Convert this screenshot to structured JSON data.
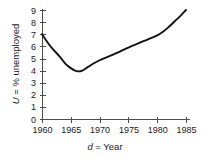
{
  "chart_data": {
    "type": "line",
    "title": "",
    "subtitle": "",
    "xlabel": "d = Year",
    "xlabel_var": "d",
    "xlabel_rest": " = Year",
    "ylabel": "U = % unemployed",
    "ylabel_var": "U",
    "ylabel_rest": " = % unemployed",
    "xlim": [
      1960,
      1985
    ],
    "ylim": [
      0,
      9
    ],
    "xticks": [
      1960,
      1965,
      1970,
      1975,
      1980,
      1985
    ],
    "xtick_labels": [
      "1960",
      "1965",
      "1970",
      "1975",
      "1980",
      "1985"
    ],
    "yticks": [
      0,
      1,
      2,
      3,
      4,
      5,
      6,
      7,
      8,
      9
    ],
    "ytick_labels": [
      "0",
      "1",
      "2",
      "3",
      "4",
      "5",
      "6",
      "7",
      "8",
      "9"
    ],
    "grid": false,
    "legend": false,
    "legend_position": "none",
    "line_color": "#111111",
    "axis_color": "#4d4d4d",
    "background_color": "#ffffff",
    "series": [
      {
        "name": "U = % unemployed",
        "x": [
          1960,
          1961,
          1962,
          1963,
          1964,
          1965,
          1966,
          1967,
          1968,
          1969,
          1970,
          1971,
          1972,
          1973,
          1974,
          1975,
          1976,
          1977,
          1978,
          1979,
          1980,
          1981,
          1982,
          1983,
          1984,
          1985
        ],
        "values": [
          7.0,
          6.3,
          5.7,
          5.2,
          4.6,
          4.2,
          3.95,
          4.0,
          4.3,
          4.6,
          4.85,
          5.05,
          5.25,
          5.45,
          5.68,
          5.9,
          6.1,
          6.3,
          6.5,
          6.7,
          6.9,
          7.2,
          7.6,
          8.05,
          8.5,
          9.0
        ]
      }
    ]
  },
  "figure": {
    "plot_area": {
      "x_origin_px": 42,
      "y_origin_px": 119,
      "x_end_px": 186,
      "y_top_px": 10
    }
  }
}
